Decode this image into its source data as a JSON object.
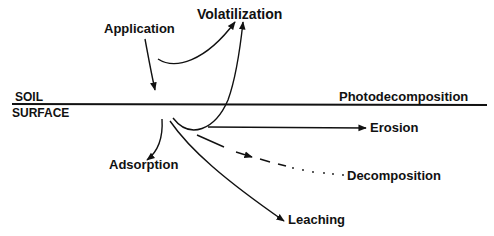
{
  "diagram": {
    "soil_surface": {
      "label_line1": "SOIL",
      "label_line2": "SURFACE"
    },
    "labels": {
      "application": "Application",
      "volatilization": "Volatilization",
      "photodecomposition": "Photodecomposition",
      "erosion": "Erosion",
      "decomposition": "Decomposition",
      "adsorption": "Adsorption",
      "leaching": "Leaching"
    },
    "colors": {
      "line": "#111111",
      "background": "#ffffff"
    },
    "processes": [
      {
        "name": "Application",
        "direction": "down to soil surface",
        "style": "solid"
      },
      {
        "name": "Volatilization",
        "direction": "up from surface and from below surface",
        "style": "solid"
      },
      {
        "name": "Photodecomposition",
        "direction": "along surface",
        "style": "none"
      },
      {
        "name": "Erosion",
        "direction": "right, below surface",
        "style": "solid"
      },
      {
        "name": "Decomposition",
        "direction": "right-down",
        "style": "dashed-dotted"
      },
      {
        "name": "Adsorption",
        "direction": "down-left",
        "style": "solid"
      },
      {
        "name": "Leaching",
        "direction": "down-right",
        "style": "solid"
      }
    ]
  }
}
